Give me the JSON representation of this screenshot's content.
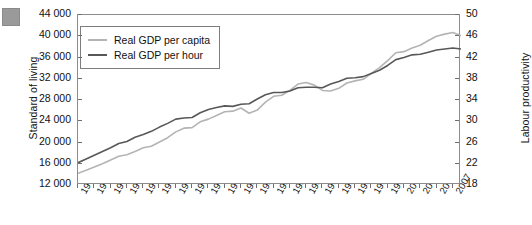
{
  "figure": {
    "corner_marker_color": "#9a9a9a"
  },
  "legend": {
    "position": "top-left-inside",
    "entries": [
      {
        "label": "Real GDP per capita",
        "color": "#b4b4b4"
      },
      {
        "label": "Real GDP per hour",
        "color": "#58585a"
      }
    ]
  },
  "axes": {
    "left": {
      "title": "Standard of living",
      "ticks": [
        "12 000",
        "16 000",
        "20 000",
        "24 000",
        "28 000",
        "32 000",
        "36 000",
        "40 000",
        "44 000"
      ]
    },
    "right": {
      "title": "Labour productivity",
      "ticks": [
        "18",
        "22",
        "26",
        "30",
        "34",
        "38",
        "42",
        "46",
        "50"
      ]
    },
    "bottom": {
      "ticks": [
        "1961",
        "1963",
        "1965",
        "1967",
        "1969",
        "1971",
        "1973",
        "1975",
        "1977",
        "1979",
        "1981",
        "1983",
        "1985",
        "1987",
        "1989",
        "1991",
        "1993",
        "1995",
        "1997",
        "1999",
        "2001",
        "2003",
        "2005",
        "2007"
      ]
    }
  },
  "chart_data": {
    "type": "line",
    "title": "",
    "xlabel": "",
    "ylabel": "Standard of living",
    "y2label": "Labour productivity",
    "grid": false,
    "legend_position": "top-left-inside",
    "xlim": [
      1961,
      2008
    ],
    "ylim": [
      12000,
      44000
    ],
    "y2lim": [
      18,
      50
    ],
    "x": [
      1961,
      1962,
      1963,
      1964,
      1965,
      1966,
      1967,
      1968,
      1969,
      1970,
      1971,
      1972,
      1973,
      1974,
      1975,
      1976,
      1977,
      1978,
      1979,
      1980,
      1981,
      1982,
      1983,
      1984,
      1985,
      1986,
      1987,
      1988,
      1989,
      1990,
      1991,
      1992,
      1993,
      1994,
      1995,
      1996,
      1997,
      1998,
      1999,
      2000,
      2001,
      2002,
      2003,
      2004,
      2005,
      2006,
      2007,
      2008
    ],
    "series": [
      {
        "name": "Real GDP per capita",
        "color": "#b4b4b4",
        "axis": "left",
        "values": [
          14200,
          14800,
          15400,
          16000,
          16700,
          17400,
          17700,
          18300,
          19000,
          19300,
          20100,
          20900,
          22000,
          22700,
          22800,
          23900,
          24400,
          25100,
          25800,
          25900,
          26500,
          25500,
          26100,
          27600,
          28700,
          28900,
          29800,
          31000,
          31300,
          30800,
          29800,
          29700,
          30200,
          31200,
          31600,
          31900,
          33000,
          34100,
          35400,
          36900,
          37100,
          37800,
          38300,
          39200,
          40000,
          40400,
          40700,
          40100
        ]
      },
      {
        "name": "Real GDP per hour",
        "color": "#58585a",
        "axis": "right",
        "values": [
          22.2,
          22.9,
          23.6,
          24.3,
          25.0,
          25.8,
          26.2,
          27.0,
          27.5,
          28.1,
          28.9,
          29.6,
          30.4,
          30.6,
          30.7,
          31.6,
          32.2,
          32.6,
          32.9,
          32.8,
          33.2,
          33.3,
          34.2,
          35.0,
          35.4,
          35.4,
          35.7,
          36.3,
          36.4,
          36.4,
          36.3,
          37.0,
          37.5,
          38.1,
          38.2,
          38.4,
          39.0,
          39.6,
          40.5,
          41.6,
          42.0,
          42.5,
          42.6,
          43.0,
          43.4,
          43.6,
          43.8,
          43.6
        ]
      }
    ]
  }
}
